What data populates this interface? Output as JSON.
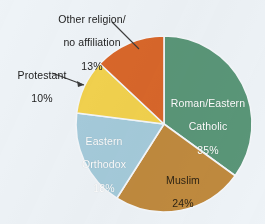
{
  "background_color": "#eef3f7",
  "chart_data": {
    "type": "pie",
    "title": "",
    "subtitle": "",
    "xlabel": "",
    "ylabel": "",
    "legend_position": "none",
    "grid": false,
    "units": "percent",
    "total": 100,
    "start_angle_deg": 0,
    "direction": "clockwise",
    "center": {
      "x": 164,
      "y": 124
    },
    "radius": 88,
    "categories": [
      "Roman/Eastern Catholic",
      "Muslim",
      "Eastern Orthodox",
      "Protestant",
      "Other religion/ no affiliation"
    ],
    "values": [
      35,
      24,
      18,
      10,
      13
    ],
    "colors": [
      "#5a9678",
      "#c08a3e",
      "#a5cbdb",
      "#f2d24e",
      "#d9672a"
    ],
    "slices": [
      {
        "name": "Roman/Eastern Catholic",
        "label_line1": "Roman/Eastern",
        "label_line2": "Catholic",
        "value": 35,
        "value_text": "35%",
        "color": "#5a9678",
        "label_placement": "inside",
        "label_color": "#ffffff",
        "start_deg": 0,
        "end_deg": 126
      },
      {
        "name": "Muslim",
        "label_line1": "Muslim",
        "label_line2": "",
        "value": 24,
        "value_text": "24%",
        "color": "#c08a3e",
        "label_placement": "inside",
        "label_color": "#2e2414",
        "start_deg": 126,
        "end_deg": 212.4
      },
      {
        "name": "Eastern Orthodox",
        "label_line1": "Eastern",
        "label_line2": "Orthodox",
        "value": 18,
        "value_text": "18%",
        "color": "#a5cbdb",
        "label_placement": "inside",
        "label_color": "#ffffff",
        "start_deg": 212.4,
        "end_deg": 277.2
      },
      {
        "name": "Protestant",
        "label_line1": "Protestant",
        "label_line2": "",
        "value": 10,
        "value_text": "10%",
        "color": "#f2d24e",
        "label_placement": "outside",
        "label_color": "#1d1d1d",
        "start_deg": 277.2,
        "end_deg": 313.2
      },
      {
        "name": "Other religion/ no affiliation",
        "label_line1": "Other religion/",
        "label_line2": "no affiliation",
        "value": 13,
        "value_text": "13%",
        "color": "#d9672a",
        "label_placement": "outside",
        "label_color": "#1d1d1d",
        "start_deg": 313.2,
        "end_deg": 360
      }
    ]
  },
  "labels": {
    "catholic": {
      "line1": "Roman/Eastern",
      "line2": "Catholic",
      "value": "35%"
    },
    "muslim": {
      "line1": "Muslim",
      "value": "24%"
    },
    "orthodox": {
      "line1": "Eastern",
      "line2": "Orthodox",
      "value": "18%"
    },
    "protestant": {
      "line1": "Protestant",
      "value": "10%"
    },
    "other": {
      "line1": "Other religion/",
      "line2": "no affiliation",
      "value": "13%"
    }
  }
}
